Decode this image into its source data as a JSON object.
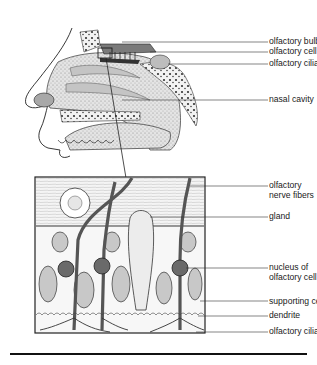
{
  "diagram": {
    "head_labels": [
      {
        "id": "olfactory-bulb",
        "text": "olfactory bulb"
      },
      {
        "id": "olfactory-cell",
        "text": "olfactory cell"
      },
      {
        "id": "olfactory-cilia",
        "text": "olfactory cilia"
      },
      {
        "id": "nasal-cavity",
        "text": "nasal cavity"
      }
    ],
    "tissue_labels": [
      {
        "id": "olfactory-nerve-fibers",
        "line1": "olfactory",
        "line2": "nerve fibers"
      },
      {
        "id": "gland",
        "line1": "gland"
      },
      {
        "id": "nucleus-of-olfactory-cell",
        "line1": "nucleus of",
        "line2": "olfactory cell"
      },
      {
        "id": "supporting-cell",
        "line1": "supporting cell"
      },
      {
        "id": "dendrite",
        "line1": "dendrite"
      },
      {
        "id": "olfactory-cilia-2",
        "line1": "olfactory cilia"
      }
    ],
    "colors": {
      "ink": "#1a1a1a",
      "shade": "#9a9a9a",
      "light": "#d6d6d6",
      "dark": "#4a4a4a"
    }
  }
}
